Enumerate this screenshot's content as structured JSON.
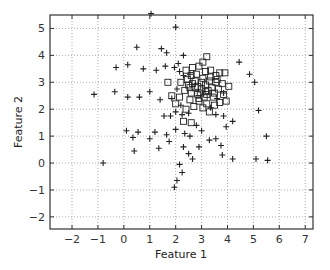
{
  "chart_data": {
    "type": "scatter",
    "title": "",
    "xlabel": "Feature 1",
    "ylabel": "Feature 2",
    "xlim": [
      -2.85,
      7.3
    ],
    "ylim": [
      -2.45,
      5.5
    ],
    "xticks": [
      -2,
      -1,
      0,
      1,
      2,
      3,
      4,
      5,
      6,
      7
    ],
    "yticks": [
      -2,
      -1,
      0,
      1,
      2,
      3,
      4,
      5
    ],
    "grid": true,
    "grid_style": "dotted",
    "legend": null,
    "series": [
      {
        "name": "class plus",
        "marker": "plus",
        "color": "#222222",
        "points": [
          [
            1.05,
            5.55
          ],
          [
            2.0,
            5.05
          ],
          [
            0.5,
            4.3
          ],
          [
            1.45,
            4.25
          ],
          [
            1.65,
            4.1
          ],
          [
            2.3,
            4.0
          ],
          [
            -0.3,
            3.55
          ],
          [
            0.15,
            3.65
          ],
          [
            0.75,
            3.5
          ],
          [
            1.25,
            3.45
          ],
          [
            1.6,
            3.6
          ],
          [
            1.95,
            3.55
          ],
          [
            2.1,
            3.7
          ],
          [
            2.55,
            3.3
          ],
          [
            2.15,
            3.4
          ],
          [
            2.3,
            3.25
          ],
          [
            4.45,
            3.75
          ],
          [
            4.85,
            3.3
          ],
          [
            5.05,
            3.0
          ],
          [
            -1.15,
            2.55
          ],
          [
            -0.35,
            2.65
          ],
          [
            0.15,
            2.45
          ],
          [
            0.6,
            2.45
          ],
          [
            1.0,
            2.65
          ],
          [
            1.4,
            2.35
          ],
          [
            1.85,
            2.4
          ],
          [
            2.05,
            2.75
          ],
          [
            2.2,
            2.15
          ],
          [
            1.8,
            1.75
          ],
          [
            2.0,
            1.9
          ],
          [
            2.25,
            1.8
          ],
          [
            1.55,
            1.75
          ],
          [
            2.5,
            1.85
          ],
          [
            3.6,
            2.4
          ],
          [
            3.85,
            2.6
          ],
          [
            3.35,
            2.05
          ],
          [
            3.95,
            1.35
          ],
          [
            3.55,
            1.8
          ],
          [
            3.85,
            1.75
          ],
          [
            4.2,
            1.55
          ],
          [
            5.2,
            1.95
          ],
          [
            5.5,
            1.0
          ],
          [
            0.1,
            1.2
          ],
          [
            0.55,
            1.15
          ],
          [
            1.2,
            1.15
          ],
          [
            1.65,
            1.05
          ],
          [
            2.0,
            1.25
          ],
          [
            2.35,
            1.1
          ],
          [
            0.35,
            0.95
          ],
          [
            1.35,
            0.55
          ],
          [
            1.0,
            0.9
          ],
          [
            1.75,
            0.8
          ],
          [
            0.4,
            0.45
          ],
          [
            2.3,
            0.6
          ],
          [
            2.5,
            0.35
          ],
          [
            2.65,
            0.15
          ],
          [
            2.9,
            0.6
          ],
          [
            3.3,
            0.85
          ],
          [
            3.55,
            0.9
          ],
          [
            3.75,
            0.65
          ],
          [
            4.2,
            0.15
          ],
          [
            5.1,
            0.15
          ],
          [
            5.55,
            0.1
          ],
          [
            3.8,
            0.3
          ],
          [
            -0.8,
            0.0
          ],
          [
            2.15,
            -0.05
          ],
          [
            2.25,
            -0.35
          ],
          [
            2.05,
            -0.65
          ],
          [
            1.95,
            -0.9
          ],
          [
            2.8,
            1.4
          ],
          [
            2.55,
            1.0
          ],
          [
            3.0,
            1.2
          ]
        ]
      },
      {
        "name": "class square",
        "marker": "square",
        "color": "#222222",
        "points": [
          [
            3.2,
            3.95
          ],
          [
            3.05,
            3.75
          ],
          [
            2.4,
            3.45
          ],
          [
            2.65,
            3.55
          ],
          [
            2.9,
            3.6
          ],
          [
            3.35,
            3.45
          ],
          [
            3.55,
            3.25
          ],
          [
            3.15,
            3.4
          ],
          [
            2.8,
            3.3
          ],
          [
            2.6,
            3.25
          ],
          [
            2.45,
            3.1
          ],
          [
            2.75,
            3.05
          ],
          [
            3.05,
            3.15
          ],
          [
            3.3,
            3.05
          ],
          [
            3.55,
            3.0
          ],
          [
            3.7,
            3.35
          ],
          [
            3.9,
            3.35
          ],
          [
            2.5,
            2.9
          ],
          [
            2.85,
            2.85
          ],
          [
            3.15,
            2.9
          ],
          [
            3.4,
            2.8
          ],
          [
            3.65,
            2.75
          ],
          [
            3.85,
            2.55
          ],
          [
            2.35,
            2.7
          ],
          [
            2.6,
            2.6
          ],
          [
            2.95,
            2.6
          ],
          [
            3.2,
            2.55
          ],
          [
            3.45,
            2.45
          ],
          [
            3.7,
            2.25
          ],
          [
            3.95,
            2.3
          ],
          [
            2.15,
            2.45
          ],
          [
            2.55,
            2.35
          ],
          [
            2.9,
            2.3
          ],
          [
            3.2,
            2.2
          ],
          [
            3.5,
            2.15
          ],
          [
            3.3,
            1.9
          ],
          [
            3.05,
            2.05
          ],
          [
            2.7,
            2.1
          ],
          [
            2.4,
            2.0
          ],
          [
            2.0,
            2.2
          ],
          [
            1.85,
            2.5
          ],
          [
            1.7,
            3.0
          ],
          [
            2.2,
            3.0
          ],
          [
            3.8,
            2.95
          ],
          [
            4.05,
            2.85
          ],
          [
            3.0,
            2.75
          ],
          [
            3.25,
            2.7
          ],
          [
            2.75,
            2.8
          ],
          [
            3.1,
            2.45
          ],
          [
            2.85,
            2.55
          ],
          [
            2.3,
            1.55
          ],
          [
            2.6,
            1.5
          ],
          [
            3.6,
            3.1
          ],
          [
            3.35,
            3.2
          ],
          [
            2.55,
            2.8
          ],
          [
            3.5,
            2.6
          ],
          [
            2.65,
            2.95
          ],
          [
            3.0,
            3.0
          ],
          [
            2.9,
            2.4
          ],
          [
            3.15,
            2.65
          ]
        ]
      }
    ]
  }
}
